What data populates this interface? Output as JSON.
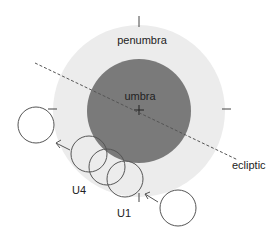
{
  "diagram": {
    "labels": {
      "penumbra": "penumbra",
      "umbra": "umbra",
      "ecliptic": "ecliptic",
      "u4": "U4",
      "u1": "U1"
    },
    "colors": {
      "penumbra": "#ececec",
      "umbra": "#7a7a7a",
      "moon_outline": "#555555",
      "ecliptic": "#555555",
      "text": "#222222"
    },
    "shadow_center": [
      139,
      111
    ],
    "penumbra_radius": 86,
    "umbra_radius": 52,
    "moon_radius": 18,
    "moon_positions": [
      {
        "x": 36,
        "y": 125,
        "note": "after leaving penumbra"
      },
      {
        "x": 89,
        "y": 154,
        "note": "U4"
      },
      {
        "x": 107,
        "y": 167,
        "note": "mid"
      },
      {
        "x": 125,
        "y": 179,
        "note": "U1"
      },
      {
        "x": 178,
        "y": 208,
        "note": "before entering penumbra"
      }
    ]
  }
}
